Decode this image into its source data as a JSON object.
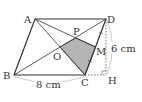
{
  "diagram": {
    "type": "geometry-parallelogram",
    "points": {
      "A": {
        "label": "A",
        "x": 35,
        "y": 19
      },
      "B": {
        "label": "B",
        "x": 14,
        "y": 75
      },
      "C": {
        "label": "C",
        "x": 85,
        "y": 75
      },
      "D": {
        "label": "D",
        "x": 106,
        "y": 19
      },
      "H": {
        "label": "H",
        "x": 106,
        "y": 75
      },
      "O": {
        "label": "O",
        "x": 60,
        "y": 47
      },
      "M": {
        "label": "M",
        "x": 95.5,
        "y": 47
      },
      "P": {
        "label": "P",
        "x": 76,
        "y": 38
      }
    },
    "measurements": {
      "bc": "8 cm",
      "dh": "6 cm"
    },
    "shaded_region": [
      "P",
      "O",
      "C",
      "M"
    ],
    "colors": {
      "line": "#333333",
      "shade": "#b5b5b5",
      "dotted": "#555555"
    }
  }
}
